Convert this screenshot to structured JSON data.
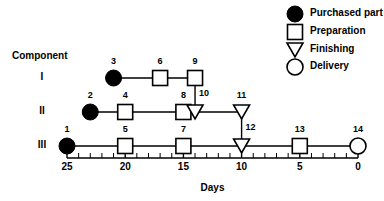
{
  "diagram": {
    "title_label": "Component",
    "axis_title": "Days",
    "axis": {
      "x_left_px": 67,
      "x_right_px": 358,
      "day_left": 25,
      "day_right": 0,
      "y_px": 158,
      "major_ticks": [
        25,
        20,
        15,
        10,
        5,
        0
      ],
      "major_tick_labels": [
        "25",
        "20",
        "15",
        "10",
        "5",
        "0"
      ],
      "minor_tick_step": 1,
      "direction": "reversed"
    },
    "rows": [
      {
        "label": "I",
        "y_px": 78
      },
      {
        "label": "II",
        "y_px": 112
      },
      {
        "label": "III",
        "y_px": 146
      }
    ],
    "nodes": [
      {
        "id": "1",
        "label": "1",
        "row": 2,
        "day": 25,
        "type": "purchased-part"
      },
      {
        "id": "2",
        "label": "2",
        "row": 1,
        "day": 23,
        "type": "purchased-part"
      },
      {
        "id": "3",
        "label": "3",
        "row": 0,
        "day": 21,
        "type": "purchased-part"
      },
      {
        "id": "4",
        "label": "4",
        "row": 1,
        "day": 20,
        "type": "preparation"
      },
      {
        "id": "5",
        "label": "5",
        "row": 2,
        "day": 20,
        "type": "preparation"
      },
      {
        "id": "6",
        "label": "6",
        "row": 0,
        "day": 17,
        "type": "preparation"
      },
      {
        "id": "7",
        "label": "7",
        "row": 2,
        "day": 15,
        "type": "preparation"
      },
      {
        "id": "8",
        "label": "8",
        "row": 1,
        "day": 15,
        "type": "preparation"
      },
      {
        "id": "9",
        "label": "9",
        "row": 0,
        "day": 14,
        "type": "preparation"
      },
      {
        "id": "10",
        "label": "10",
        "row": 1,
        "day": 14,
        "type": "finishing"
      },
      {
        "id": "11",
        "label": "11",
        "row": 1,
        "day": 10,
        "type": "finishing"
      },
      {
        "id": "12",
        "label": "12",
        "row": 2,
        "day": 10,
        "type": "finishing"
      },
      {
        "id": "13",
        "label": "13",
        "row": 2,
        "day": 5,
        "type": "preparation"
      },
      {
        "id": "14",
        "label": "14",
        "row": 2,
        "day": 0,
        "type": "delivery"
      }
    ],
    "edges": [
      {
        "from": "3",
        "to": "6",
        "kind": "horizontal"
      },
      {
        "from": "6",
        "to": "9",
        "kind": "horizontal"
      },
      {
        "from": "9",
        "to": "10",
        "kind": "vertical"
      },
      {
        "from": "2",
        "to": "4",
        "kind": "horizontal"
      },
      {
        "from": "4",
        "to": "8",
        "kind": "horizontal"
      },
      {
        "from": "8",
        "to": "10",
        "kind": "horizontal"
      },
      {
        "from": "10",
        "to": "11",
        "kind": "horizontal"
      },
      {
        "from": "11",
        "to": "12",
        "kind": "vertical"
      },
      {
        "from": "1",
        "to": "5",
        "kind": "horizontal"
      },
      {
        "from": "5",
        "to": "7",
        "kind": "horizontal"
      },
      {
        "from": "7",
        "to": "12",
        "kind": "horizontal"
      },
      {
        "from": "12",
        "to": "13",
        "kind": "horizontal"
      },
      {
        "from": "13",
        "to": "14",
        "kind": "horizontal"
      }
    ]
  },
  "legend": {
    "x_symbol_px": 295,
    "x_text_px": 310,
    "items": [
      {
        "label": "Purchased part",
        "type": "purchased-part",
        "y_px": 14
      },
      {
        "label": "Preparation",
        "type": "preparation",
        "y_px": 32
      },
      {
        "label": "Finishing",
        "type": "finishing",
        "y_px": 50
      },
      {
        "label": "Delivery",
        "type": "delivery",
        "y_px": 67
      }
    ]
  },
  "labels": {
    "component_x_px": 12,
    "component_y_px": 56,
    "row_label_x_px": 42
  },
  "colors": {
    "stroke": "#000000",
    "fill_solid": "#000000",
    "fill_open": "#ffffff",
    "background": "#ffffff"
  }
}
